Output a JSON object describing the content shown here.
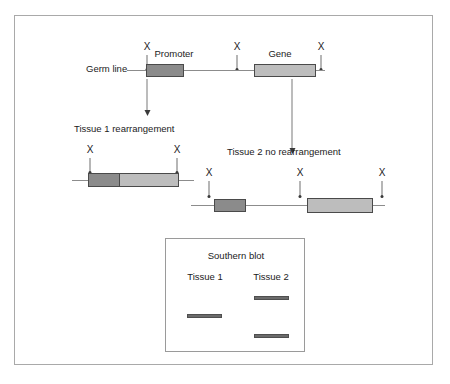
{
  "germline": {
    "label": "Germ line",
    "promoter_label": "Promoter",
    "gene_label": "Gene",
    "restriction_sites": [
      {
        "name": "X",
        "x": 146
      },
      {
        "name": "X",
        "x": 236
      },
      {
        "name": "X",
        "x": 320
      }
    ]
  },
  "tissue1": {
    "label": "Tissue 1 rearrangement",
    "restriction_sites": [
      {
        "name": "X",
        "x": 89
      },
      {
        "name": "X",
        "x": 176
      }
    ]
  },
  "tissue2": {
    "label": "Tissue 2 no rearrangement",
    "restriction_sites": [
      {
        "name": "X",
        "x": 208
      },
      {
        "name": "X",
        "x": 299
      },
      {
        "name": "X",
        "x": 381
      }
    ]
  },
  "blot": {
    "title": "Southern blot",
    "lane1_label": "Tissue 1",
    "lane2_label": "Tissue 2",
    "bands": [
      {
        "lane": "Tissue 1",
        "position": "middle"
      },
      {
        "lane": "Tissue 2",
        "position": "upper"
      },
      {
        "lane": "Tissue 2",
        "position": "lower"
      }
    ]
  },
  "colors": {
    "promoter": "#8b8b8b",
    "gene": "#bdbdbd",
    "band": "#6b6b6b",
    "line": "#8c8c8c",
    "frame": "#a9a9a9",
    "text": "#1b1b1b"
  }
}
